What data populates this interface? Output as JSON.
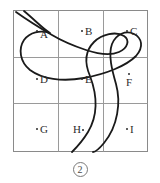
{
  "figure": {
    "caption": "2",
    "grid": {
      "rows": 3,
      "cols": 3,
      "border_color": "#8a8a8a",
      "line_color": "#9a9a9a",
      "bounds": {
        "x": 13,
        "y": 10,
        "width": 135,
        "height": 142
      }
    },
    "cells": [
      {
        "id": "A",
        "label": "A",
        "row": 0,
        "col": 0,
        "dot_x": 36,
        "dot_y": 30,
        "label_x": 40,
        "label_y": 29
      },
      {
        "id": "B",
        "label": "B",
        "row": 0,
        "col": 1,
        "dot_x": 81,
        "dot_y": 30,
        "label_x": 85,
        "label_y": 26
      },
      {
        "id": "C",
        "label": "C",
        "row": 0,
        "col": 2,
        "dot_x": 126,
        "dot_y": 30,
        "label_x": 130,
        "label_y": 26
      },
      {
        "id": "D",
        "label": "D",
        "row": 1,
        "col": 0,
        "dot_x": 36,
        "dot_y": 78,
        "label_x": 40,
        "label_y": 74
      },
      {
        "id": "E",
        "label": "E",
        "row": 1,
        "col": 1,
        "dot_x": 81,
        "dot_y": 78,
        "label_x": 85,
        "label_y": 74
      },
      {
        "id": "F",
        "label": "F",
        "row": 1,
        "col": 2,
        "dot_x": 128,
        "dot_y": 73,
        "label_x": 126,
        "label_y": 77
      },
      {
        "id": "G",
        "label": "G",
        "row": 2,
        "col": 0,
        "dot_x": 36,
        "dot_y": 128,
        "label_x": 40,
        "label_y": 124
      },
      {
        "id": "H",
        "label": "H",
        "row": 2,
        "col": 1,
        "dot_x": 82,
        "dot_y": 129,
        "label_x": 73,
        "label_y": 124
      },
      {
        "id": "I",
        "label": "I",
        "row": 2,
        "col": 2,
        "dot_x": 126,
        "dot_y": 128,
        "label_x": 130,
        "label_y": 124
      }
    ],
    "curve": {
      "name": "river-curve",
      "color": "#1a1a1a",
      "stroke_width": 1.8,
      "description": "double-banked S-shaped river crossing the grid",
      "bank_outer": "M 16 12 C 30 22 40 28 52 35 C 62 41 74 46 86 50 C 98 54 110 56 119 52 C 128 48 130 40 124 36 C 116 31 102 34 94 42 C 86 50 84 62 90 76 C 96 92 100 112 88 132 C 82 142 76 148 72 152",
      "bank_inner": "M 24 11 C 36 21 42 28 50 33 C 40 30 30 32 24 40 C 18 49 20 62 30 70 C 42 79 62 82 84 78 C 106 74 126 66 136 56 C 144 47 142 38 134 34 C 126 30 116 34 112 44 C 108 55 112 70 116 84 C 121 102 118 126 104 143 C 99 149 95 152 93 152"
    }
  }
}
